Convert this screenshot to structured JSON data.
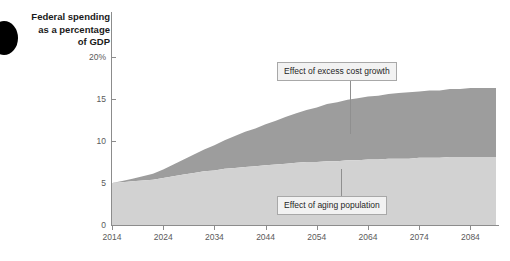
{
  "figure": {
    "axis_title": "Federal spending\nas a percentage\nof GDP",
    "decoration": "black-circle-blob"
  },
  "chart_data": {
    "type": "area",
    "title": "Federal spending as a percentage of GDP",
    "xlabel": "",
    "ylabel": "Federal spending as a percentage of GDP",
    "xlim": [
      2014,
      2089
    ],
    "ylim": [
      0,
      20
    ],
    "grid": false,
    "legend_position": "inline-annotations",
    "stacked": true,
    "x_ticks": [
      "2014",
      "2024",
      "2034",
      "2044",
      "2054",
      "2064",
      "2074",
      "2084"
    ],
    "x_tick_values": [
      2014,
      2024,
      2034,
      2044,
      2054,
      2064,
      2074,
      2084
    ],
    "y_ticks": [
      "0",
      "5",
      "10",
      "15",
      "20%"
    ],
    "y_tick_values": [
      0,
      5,
      10,
      15,
      20
    ],
    "x": [
      2014,
      2016,
      2018,
      2020,
      2022,
      2024,
      2026,
      2028,
      2030,
      2032,
      2034,
      2036,
      2038,
      2040,
      2042,
      2044,
      2046,
      2048,
      2050,
      2052,
      2054,
      2056,
      2058,
      2060,
      2062,
      2064,
      2066,
      2068,
      2070,
      2072,
      2074,
      2076,
      2078,
      2080,
      2082,
      2084,
      2086,
      2089
    ],
    "series": [
      {
        "name": "Effect of aging population",
        "color": "#d2d2d2",
        "values": [
          5.0,
          5.1,
          5.2,
          5.3,
          5.4,
          5.6,
          5.8,
          6.0,
          6.2,
          6.4,
          6.5,
          6.7,
          6.8,
          6.9,
          7.0,
          7.1,
          7.2,
          7.3,
          7.4,
          7.5,
          7.5,
          7.6,
          7.6,
          7.7,
          7.7,
          7.8,
          7.8,
          7.9,
          7.9,
          7.9,
          8.0,
          8.0,
          8.0,
          8.1,
          8.1,
          8.1,
          8.1,
          8.1
        ]
      },
      {
        "name": "Effect of excess cost growth",
        "color": "#9d9d9d",
        "values": [
          0.0,
          0.15,
          0.3,
          0.5,
          0.7,
          1.0,
          1.4,
          1.8,
          2.2,
          2.6,
          3.0,
          3.4,
          3.8,
          4.2,
          4.5,
          4.9,
          5.2,
          5.6,
          5.9,
          6.2,
          6.5,
          6.8,
          7.0,
          7.2,
          7.4,
          7.5,
          7.6,
          7.7,
          7.8,
          7.9,
          7.9,
          8.0,
          8.0,
          8.1,
          8.1,
          8.2,
          8.2,
          8.2
        ]
      }
    ],
    "annotations": [
      {
        "label": "Effect of excess cost growth",
        "points_to_series": "Effect of excess cost growth",
        "at_x": 2060
      },
      {
        "label": "Effect of aging population",
        "points_to_series": "Effect of aging population",
        "at_x": 2058
      }
    ]
  }
}
